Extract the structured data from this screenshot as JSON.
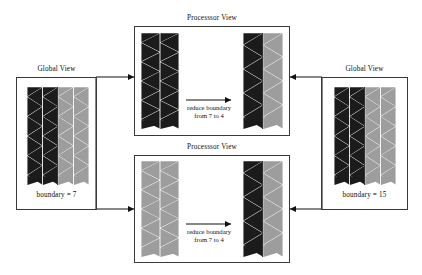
{
  "diagram": {
    "title_left_view": "Global View",
    "title_right_view": "Global View",
    "title_proc_top": "Processsor View",
    "title_proc_bottom": "Processsor View",
    "left_boundary_label": "boundary = 7",
    "right_boundary_label": "boundary = 15",
    "reduce_line1_top": "reduce boundary",
    "reduce_line2_top": "from 7 to 4",
    "reduce_line1_bottom": "reduce boundary",
    "reduce_line2_bottom": "from 7 to 4",
    "colors": {
      "dark_triangle": "#1b1b1b",
      "gray_triangle": "#9d9d9d",
      "box_border": "#3a3a3a",
      "line": "#111111",
      "background": "#ffffff"
    },
    "meshes": {
      "global_left": {
        "name": "global-view-left-mesh",
        "columns": [
          "dark",
          "dark",
          "gray",
          "gray"
        ],
        "rows": 5
      },
      "global_right": {
        "name": "global-view-right-mesh",
        "columns": [
          "dark",
          "dark",
          "gray",
          "gray"
        ],
        "rows": 5
      },
      "proc_top_before": {
        "name": "processor-top-before-mesh",
        "columns": [
          "dark",
          "dark"
        ],
        "rows": 5
      },
      "proc_top_after": {
        "name": "processor-top-after-mesh",
        "columns": [
          "dark",
          "gray"
        ],
        "rows": 4
      },
      "proc_bottom_before": {
        "name": "processor-bottom-before-mesh",
        "columns": [
          "gray",
          "gray"
        ],
        "rows": 5
      },
      "proc_bottom_after": {
        "name": "processor-bottom-after-mesh",
        "columns": [
          "dark",
          "gray"
        ],
        "rows": 4
      }
    }
  }
}
